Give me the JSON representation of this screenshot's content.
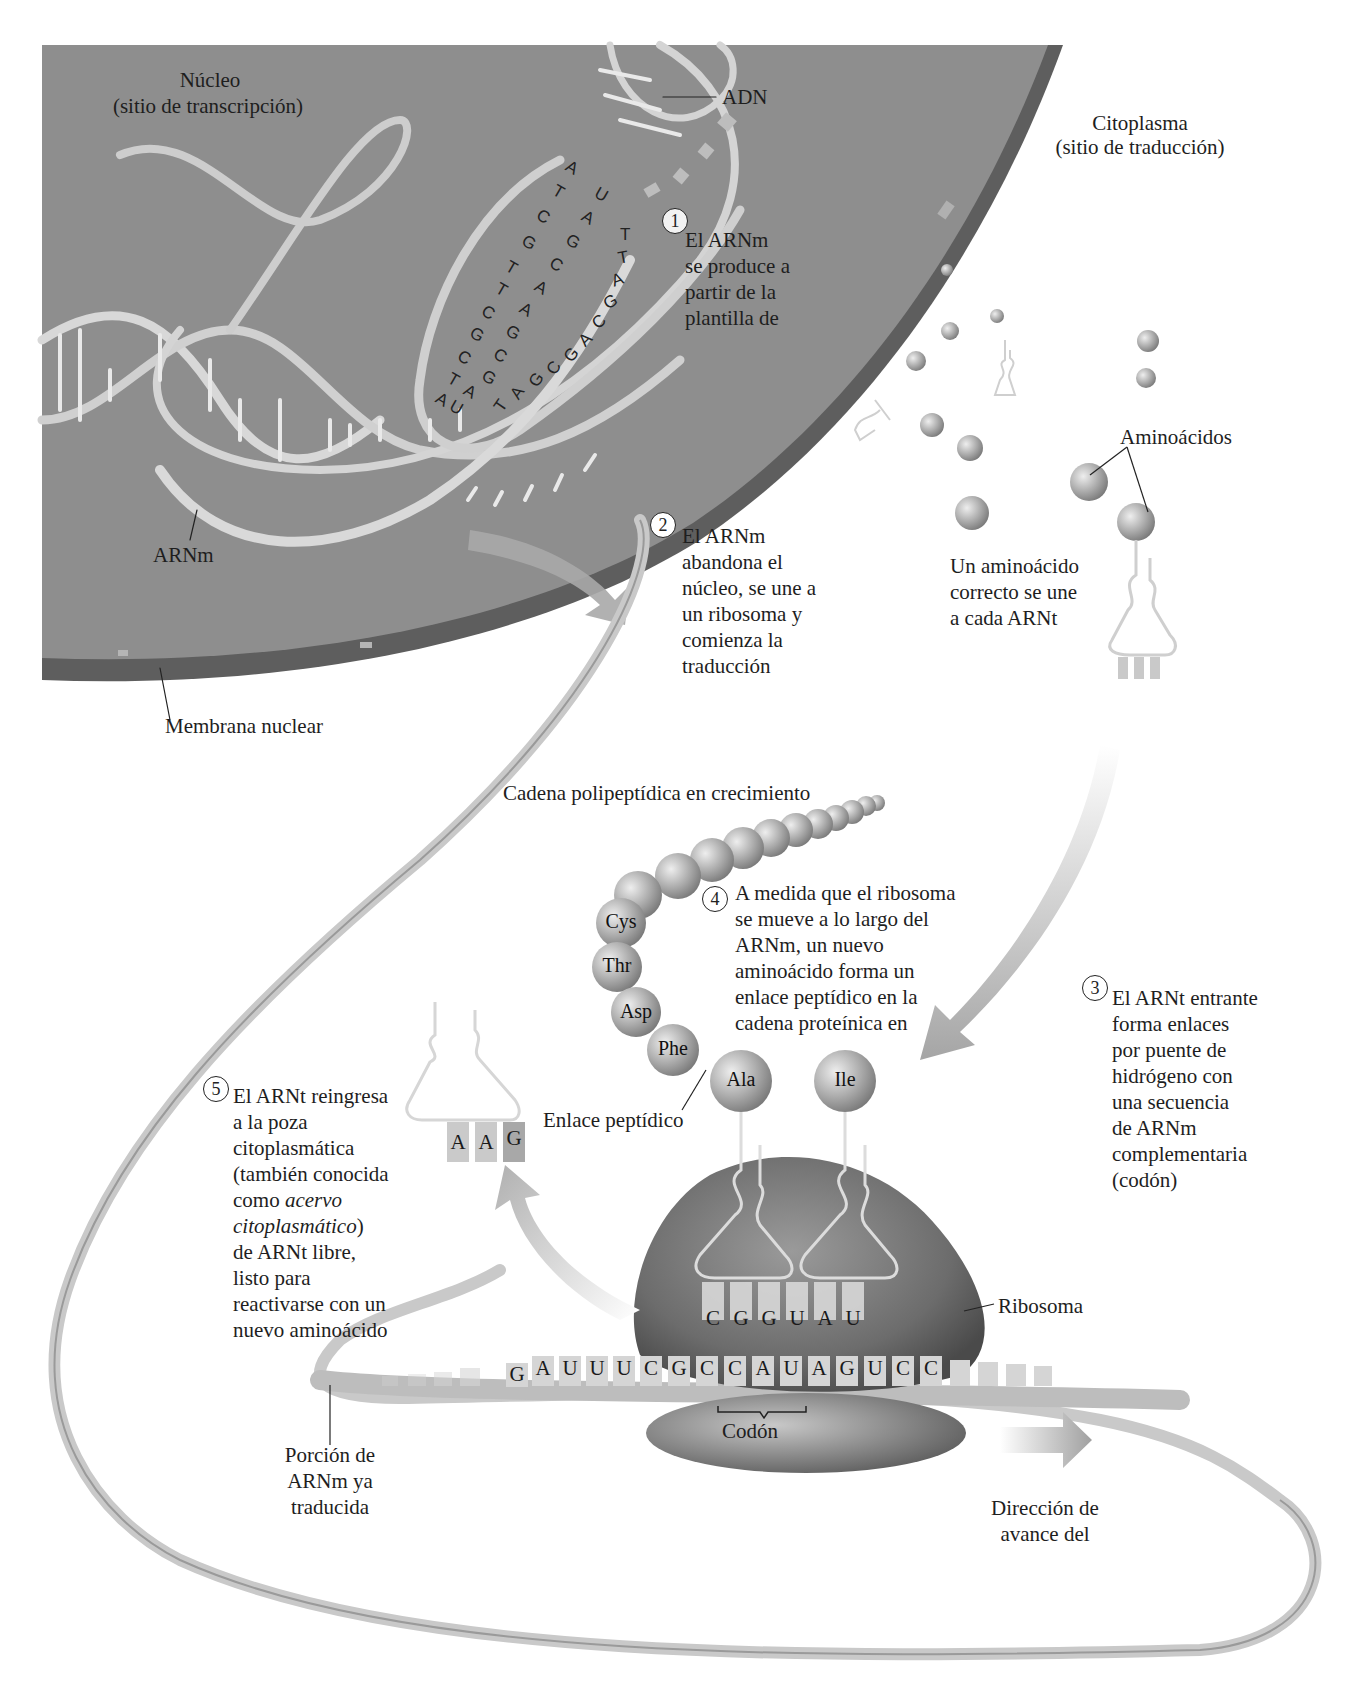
{
  "nucleus": {
    "title": "Núcleo",
    "subtitle": "(sitio de transcripción)",
    "dna_label": "ADN",
    "mrna_label": "ARNm",
    "membrane_label": "Membrana nuclear",
    "colors": {
      "nucleus_fill": "#8c8c8c",
      "membrane": "#5e5e5e",
      "strand": "#d6d6d6"
    }
  },
  "cytoplasm": {
    "title": "Citoplasma",
    "subtitle": "(sitio de traducción)",
    "amino_acids_label": "Aminoácidos",
    "attach_caption": [
      "Un aminoácido",
      "correcto se une",
      "a cada ARNt"
    ]
  },
  "dna_letters": {
    "template_strand": [
      "A",
      "T",
      "C",
      "G",
      "T",
      "T",
      "C",
      "G",
      "C",
      "T",
      "A"
    ],
    "mrna_strand": [
      "U",
      "A",
      "G",
      "C",
      "A",
      "A",
      "G",
      "C",
      "G",
      "A",
      "U"
    ],
    "lower_strand": [
      "T",
      "T",
      "A",
      "G",
      "C",
      "A",
      "G",
      "C",
      "G",
      "A",
      "T"
    ]
  },
  "steps": [
    {
      "number": "1",
      "lines": [
        "El ARNm",
        "se produce a",
        "partir de la",
        "plantilla de"
      ]
    },
    {
      "number": "2",
      "lines": [
        "El ARNm",
        "abandona el",
        "núcleo, se une a",
        "un ribosoma y",
        "comienza la",
        "traducción"
      ]
    },
    {
      "number": "3",
      "lines": [
        "El ARNt entrante",
        "forma enlaces",
        "por puente de",
        "hidrógeno con",
        "una secuencia",
        "de ARNm",
        "complementaria",
        "(codón)"
      ]
    },
    {
      "number": "4",
      "lines": [
        "A medida que el ribosoma",
        "se mueve a lo largo del",
        "ARNm, un nuevo",
        "aminoácido forma un",
        "enlace peptídico en la",
        "cadena proteínica en"
      ]
    },
    {
      "number": "5",
      "lines": [
        "El ARNt reingresa",
        "a la poza",
        "citoplasmática",
        "(también conocida",
        "como ",
        "acervo",
        "citoplasmático",
        ")",
        "de ARNt libre,",
        "listo para",
        "reactivarse con un",
        "nuevo aminoácido"
      ]
    }
  ],
  "translation": {
    "chain_label": "Cadena polipeptídica en crecimiento",
    "amino_acids": [
      "Cys",
      "Thr",
      "Asp",
      "Phe",
      "Ala",
      "Ile"
    ],
    "peptide_bond_label": "Enlace peptídico",
    "ribosome_label": "Ribosoma",
    "anticodons": [
      "C",
      "G",
      "G",
      "U",
      "A",
      "U"
    ],
    "mrna_sequence": [
      "G",
      "A",
      "U",
      "U",
      "U",
      "C",
      "G",
      "C",
      "C",
      "A",
      "U",
      "A",
      "G",
      "U",
      "C",
      "C"
    ],
    "codon_label": "Codón",
    "free_trna_anticodon": [
      "A",
      "A",
      "G"
    ],
    "translated_label": [
      "Porción de",
      "ARNm ya",
      "traducida"
    ],
    "direction_label": [
      "Dirección de",
      "avance del"
    ]
  }
}
